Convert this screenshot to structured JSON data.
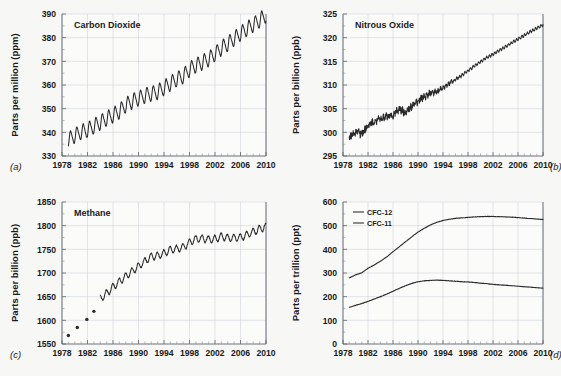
{
  "figure": {
    "background_color": "#f7f7f6",
    "line_color": "#2a2a2a",
    "grid_color": "#cfd4dd",
    "axis_color": "#5c6470"
  },
  "panels": [
    {
      "letter": "(a)",
      "letter_position": "bottom-left",
      "title": "Carbon Dioxide",
      "ylabel": "Parts per million (ppm)",
      "yticks": [
        "330",
        "340",
        "350",
        "360",
        "370",
        "380",
        "390"
      ],
      "xticks": [
        "1978",
        "1982",
        "1986",
        "1990",
        "1994",
        "1998",
        "2002",
        "2006",
        "2010"
      ]
    },
    {
      "letter": "(b)",
      "letter_position": "bottom-right",
      "title": "Nitrous Oxide",
      "ylabel": "Parts per billion (ppb)",
      "yticks": [
        "295",
        "300",
        "305",
        "310",
        "315",
        "320",
        "325"
      ],
      "xticks": [
        "1978",
        "1982",
        "1986",
        "1990",
        "1994",
        "1998",
        "2002",
        "2006",
        "2010"
      ]
    },
    {
      "letter": "(c)",
      "letter_position": "bottom-left",
      "title": "Methane",
      "ylabel": "Parts per billion (ppb)",
      "yticks": [
        "1550",
        "1600",
        "1650",
        "1700",
        "1750",
        "1800",
        "1850"
      ],
      "xticks": [
        "1978",
        "1982",
        "1986",
        "1990",
        "1994",
        "1998",
        "2002",
        "2006",
        "2010"
      ]
    },
    {
      "letter": "(d)",
      "letter_position": "bottom-right",
      "title": "",
      "ylabel": "Parts per trillion (ppt)",
      "yticks": [
        "0",
        "100",
        "200",
        "300",
        "400",
        "500",
        "600"
      ],
      "xticks": [
        "1978",
        "1982",
        "1986",
        "1990",
        "1994",
        "1998",
        "2002",
        "2006",
        "2010"
      ],
      "legend": [
        {
          "label": "CFC-12"
        },
        {
          "label": "CFC-11"
        }
      ]
    }
  ],
  "chart_data": [
    {
      "type": "line",
      "panel": "a",
      "title": "Carbon Dioxide",
      "xlabel": "",
      "ylabel": "Parts per million (ppm)",
      "xlim": [
        1978,
        2010
      ],
      "ylim": [
        330,
        390
      ],
      "grid": true,
      "legend": "none",
      "seasonal_amplitude_ppm": 3.0,
      "seasonal_period_years": 1.0,
      "series": [
        {
          "name": "CO2 annual mean (ppm)",
          "x": [
            1979,
            1980,
            1981,
            1982,
            1983,
            1984,
            1985,
            1986,
            1987,
            1988,
            1989,
            1990,
            1991,
            1992,
            1993,
            1994,
            1995,
            1996,
            1997,
            1998,
            1999,
            2000,
            2001,
            2002,
            2003,
            2004,
            2005,
            2006,
            2007,
            2008,
            2009,
            2010
          ],
          "values": [
            336.8,
            338.7,
            340.1,
            341.0,
            342.6,
            344.2,
            345.8,
            347.2,
            348.9,
            351.5,
            353.1,
            354.3,
            355.5,
            356.3,
            357.0,
            358.8,
            360.7,
            362.5,
            363.7,
            366.6,
            368.3,
            369.5,
            371.0,
            373.1,
            375.6,
            377.4,
            379.6,
            381.8,
            383.7,
            385.5,
            387.3,
            389.6
          ]
        }
      ]
    },
    {
      "type": "line",
      "panel": "b",
      "title": "Nitrous Oxide",
      "xlabel": "",
      "ylabel": "Parts per billion (ppb)",
      "xlim": [
        1978,
        2010
      ],
      "ylim": [
        295,
        325
      ],
      "grid": true,
      "legend": "none",
      "noise_note": "high short-term scatter before 1990, smoother afterwards",
      "series": [
        {
          "name": "N2O (ppb)",
          "x": [
            1979,
            1980,
            1981,
            1982,
            1983,
            1984,
            1985,
            1986,
            1987,
            1988,
            1989,
            1990,
            1991,
            1992,
            1993,
            1994,
            1995,
            1996,
            1997,
            1998,
            1999,
            2000,
            2001,
            2002,
            2003,
            2004,
            2005,
            2006,
            2007,
            2008,
            2009,
            2010
          ],
          "values": [
            298.9,
            300.0,
            299.7,
            301.5,
            302.2,
            303.0,
            303.3,
            303.6,
            305.0,
            304.2,
            305.5,
            306.6,
            307.6,
            308.3,
            308.6,
            309.4,
            310.3,
            311.2,
            312.0,
            313.0,
            314.0,
            314.9,
            315.8,
            316.5,
            317.3,
            318.1,
            318.9,
            319.7,
            320.5,
            321.3,
            322.0,
            322.7
          ]
        }
      ]
    },
    {
      "type": "line",
      "panel": "c",
      "title": "Methane",
      "xlabel": "",
      "ylabel": "Parts per billion (ppb)",
      "xlim": [
        1978,
        2010
      ],
      "ylim": [
        1550,
        1850
      ],
      "grid": true,
      "legend": "none",
      "early_points_note": "four isolated discrete measurement dots before continuous record begins in 1984",
      "series": [
        {
          "name": "CH4 early discrete samples (ppb)",
          "marker": "dot",
          "x": [
            1979.0,
            1980.4,
            1981.9,
            1983.0
          ],
          "values": [
            1568,
            1585,
            1602,
            1619
          ]
        },
        {
          "name": "CH4 continuous (ppb)",
          "x": [
            1984,
            1985,
            1986,
            1987,
            1988,
            1989,
            1990,
            1991,
            1992,
            1993,
            1994,
            1995,
            1996,
            1997,
            1998,
            1999,
            2000,
            2001,
            2002,
            2003,
            2004,
            2005,
            2006,
            2007,
            2008,
            2009,
            2010
          ],
          "values": [
            1645,
            1657,
            1670,
            1682,
            1693,
            1704,
            1714,
            1725,
            1735,
            1736,
            1742,
            1749,
            1751,
            1754,
            1765,
            1772,
            1773,
            1771,
            1772,
            1777,
            1774,
            1774,
            1775,
            1781,
            1787,
            1793,
            1798
          ]
        }
      ]
    },
    {
      "type": "line",
      "panel": "d",
      "title": "",
      "xlabel": "",
      "ylabel": "Parts per trillion (ppt)",
      "xlim": [
        1978,
        2010
      ],
      "ylim": [
        0,
        600
      ],
      "grid": true,
      "legend": "upper-left",
      "series": [
        {
          "name": "CFC-12",
          "x": [
            1979,
            1980,
            1981,
            1982,
            1983,
            1984,
            1985,
            1986,
            1987,
            1988,
            1989,
            1990,
            1991,
            1992,
            1993,
            1994,
            1995,
            1996,
            1997,
            1998,
            1999,
            2000,
            2001,
            2002,
            2003,
            2004,
            2005,
            2006,
            2007,
            2008,
            2009,
            2010
          ],
          "values": [
            279,
            292,
            301,
            320,
            334,
            350,
            368,
            390,
            411,
            432,
            453,
            473,
            489,
            503,
            514,
            522,
            527,
            531,
            533,
            535,
            537,
            538,
            539,
            539,
            538,
            537,
            536,
            534,
            532,
            530,
            528,
            526
          ]
        },
        {
          "name": "CFC-11",
          "x": [
            1979,
            1980,
            1981,
            1982,
            1983,
            1984,
            1985,
            1986,
            1987,
            1988,
            1989,
            1990,
            1991,
            1992,
            1993,
            1994,
            1995,
            1996,
            1997,
            1998,
            1999,
            2000,
            2001,
            2002,
            2003,
            2004,
            2005,
            2006,
            2007,
            2008,
            2009,
            2010
          ],
          "values": [
            155,
            163,
            171,
            180,
            190,
            200,
            211,
            223,
            235,
            246,
            256,
            263,
            267,
            269,
            270,
            269,
            267,
            265,
            263,
            262,
            260,
            257,
            255,
            252,
            250,
            248,
            246,
            244,
            242,
            240,
            238,
            236
          ]
        }
      ]
    }
  ]
}
